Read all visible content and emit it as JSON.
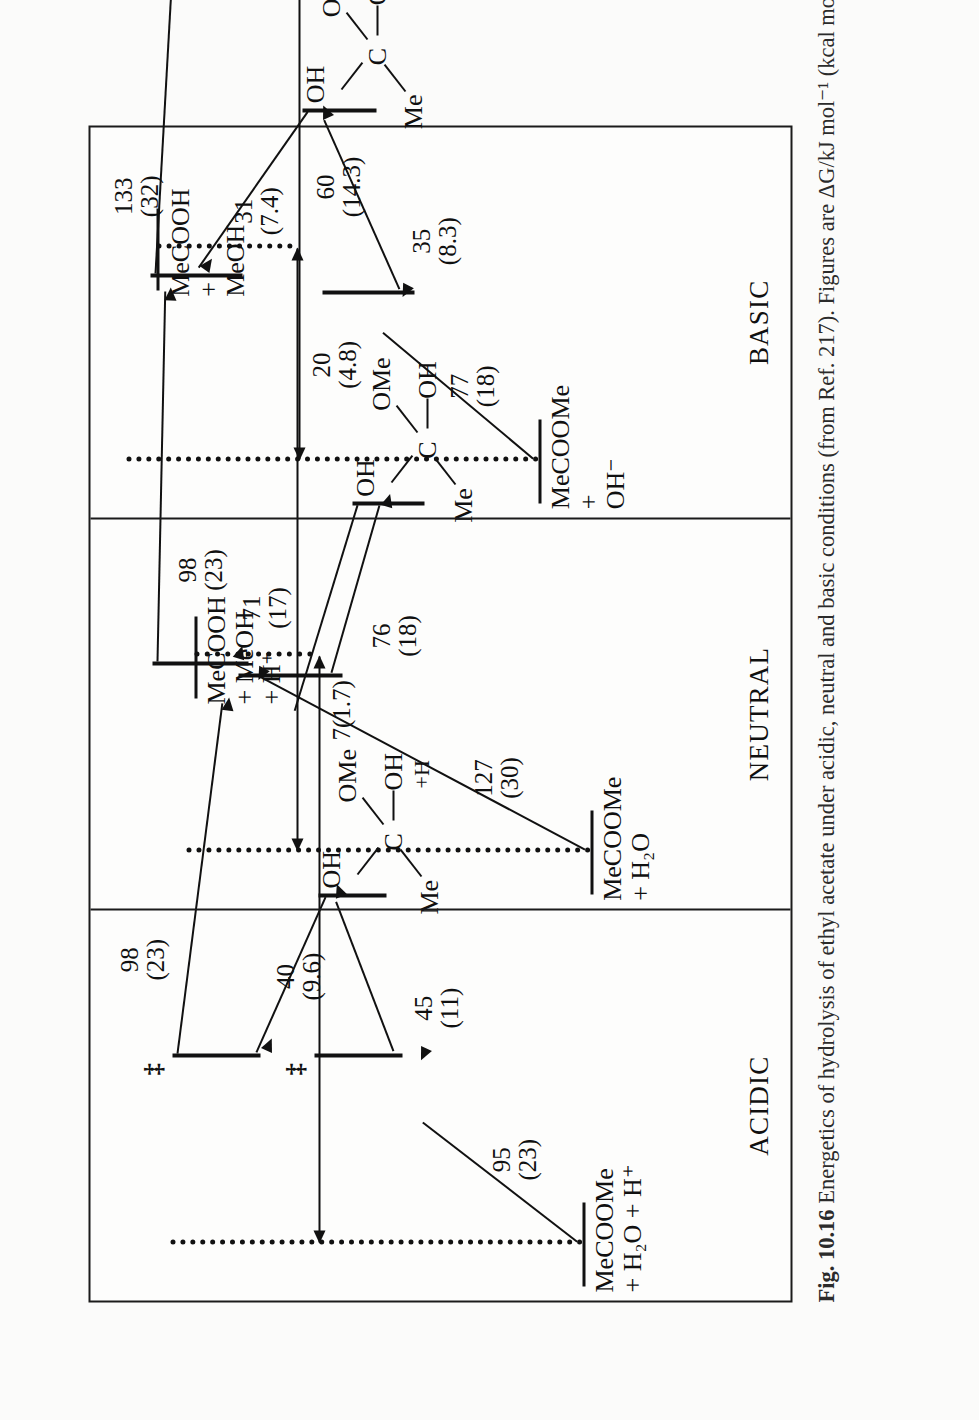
{
  "figure": {
    "caption_number": "Fig. 10.16",
    "caption_text": "Energetics of hydrolysis of ethyl acetate under acidic, neutral and basic conditions (from Ref. 217). Figures are ΔG/kJ mol⁻¹ (kcal mol⁻¹)"
  },
  "panels": [
    {
      "title": "ACIDIC",
      "reactant": {
        "line1": "MeCOOMe",
        "line2": "+ H₂O + H⁺"
      },
      "product": {
        "line1": "MeCOOH",
        "line2": "+ MeOH",
        "line3": "+ H⁺"
      },
      "intermediate": {
        "me": "Me",
        "c": "C",
        "oh_top": "OH",
        "ome": "OMe",
        "oh_right": "OH",
        "plus_h": "+H"
      },
      "barriers": {
        "ts1_forward": {
          "kj": "95",
          "kcal": "(23)"
        },
        "ts1_back": {
          "kj": "45",
          "kcal": "(11)"
        },
        "ts2_forward": {
          "kj": "40",
          "kcal": "(9.6)"
        },
        "ts2_to_product": {
          "kj": "98",
          "kcal": "(23)"
        }
      },
      "overall": {
        "label": "7(1.7)"
      },
      "ts_marks": [
        "‡",
        "‡"
      ]
    },
    {
      "title": "NEUTRAL",
      "reactant": {
        "line1": "MeCOOMe",
        "line2": "+ H₂O"
      },
      "product": {
        "line1": "MeCOOH",
        "line2": "+",
        "line3": "MeOH"
      },
      "intermediate": {
        "me": "Me",
        "c": "C",
        "oh_top": "OH",
        "ome": "OMe",
        "oh_right": "OH"
      },
      "barriers": {
        "ts1_forward": {
          "kj": "127",
          "kcal": "(30)"
        },
        "ts1_back": {
          "kj": "76",
          "kcal": "(18)"
        },
        "ts2_forward": {
          "kj": "71",
          "kcal": "(17)"
        },
        "ts2_to_product": {
          "kj": "98",
          "kcal": "(23)"
        }
      },
      "overall": {
        "kj": "20",
        "kcal": "(4.8)"
      },
      "ts_marks": [
        "",
        ""
      ]
    },
    {
      "title": "BASIC",
      "reactant": {
        "line1": "MeCOOMe",
        "line2": "+",
        "line3": "OH⁻"
      },
      "product": {
        "line1": "MeCOO⁻",
        "line2": "+",
        "line3": "MeOH"
      },
      "intermediate": {
        "me": "Me",
        "c": "C",
        "oh_top": "OH",
        "ome": "OMe",
        "o_minus": "O–"
      },
      "barriers": {
        "ts1_forward": {
          "kj": "77",
          "kcal": "(18)"
        },
        "ts1_back": {
          "kj": "35",
          "kcal": "(8.3)"
        },
        "ts2_forward": {
          "kj": "31",
          "kcal": "(7.4)"
        },
        "ts2_to_product": {
          "kj": "133",
          "kcal": "(32)"
        }
      },
      "overall": {
        "kj": "60",
        "kcal": "(14.3)"
      },
      "ts_marks": [
        "",
        ""
      ]
    }
  ]
}
